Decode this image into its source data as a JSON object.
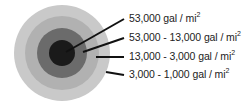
{
  "diagram": {
    "type": "concentric-zones",
    "center": [
      62,
      53
    ],
    "rings": [
      {
        "name": "outer-zone",
        "radius": 48,
        "color": "#c9c9c9"
      },
      {
        "name": "zone-3",
        "radius": 37,
        "color": "#b1b1b1"
      },
      {
        "name": "zone-2",
        "radius": 25,
        "color": "#6b6b6b"
      },
      {
        "name": "core",
        "radius": 13,
        "color": "#1a1a1a"
      }
    ],
    "labels": [
      {
        "value": "53,000 gal / mi",
        "sup": "2"
      },
      {
        "value": "53,000 - 13,000 gal / mi",
        "sup": "2"
      },
      {
        "value": "13,000 - 3,000 gal / mi",
        "sup": "2"
      },
      {
        "value": "3,000 - 1,000 gal / mi",
        "sup": "2"
      }
    ],
    "leader_color": "#111111"
  }
}
